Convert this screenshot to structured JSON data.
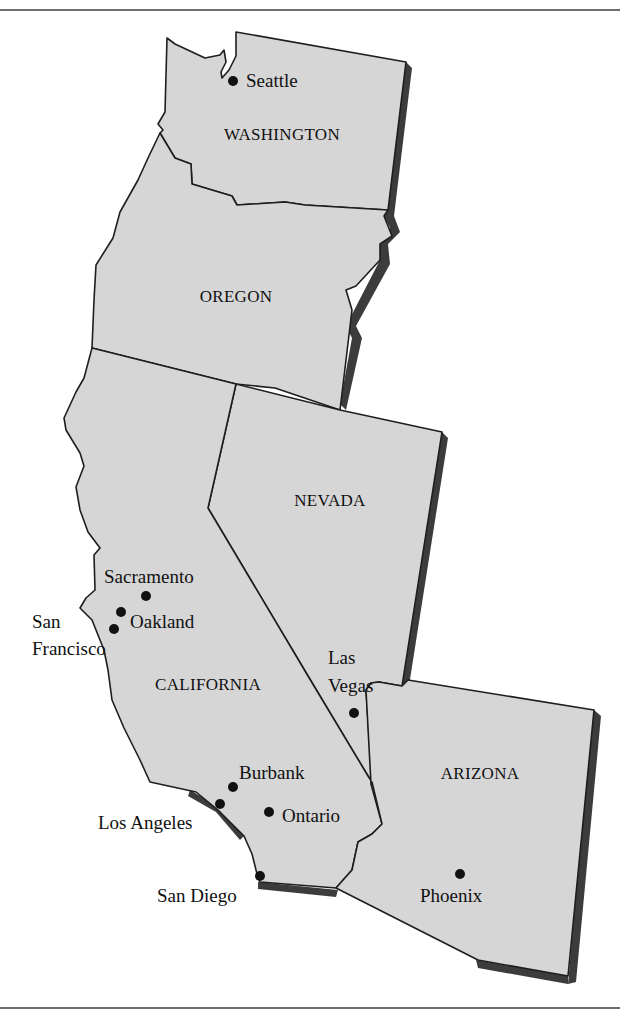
{
  "map": {
    "title": "",
    "region": "Western United States",
    "colors": {
      "land": "#d6d6d6",
      "border": "#1e1e1e",
      "shadow": "#3c3c3c",
      "text": "#111111",
      "frame_rule": "#6e6e6e"
    },
    "states": [
      {
        "id": "washington",
        "label": "WASHINGTON",
        "label_x": 282,
        "label_y": 140
      },
      {
        "id": "oregon",
        "label": "OREGON",
        "label_x": 236,
        "label_y": 302
      },
      {
        "id": "nevada",
        "label": "NEVADA",
        "label_x": 330,
        "label_y": 506
      },
      {
        "id": "california",
        "label": "CALIFORNIA",
        "label_x": 208,
        "label_y": 690
      },
      {
        "id": "arizona",
        "label": "ARIZONA",
        "label_x": 480,
        "label_y": 779
      }
    ],
    "cities": [
      {
        "id": "seattle",
        "name": "Seattle",
        "dot_x": 233,
        "dot_y": 81,
        "lines": [
          "Seattle"
        ],
        "label_x": 246,
        "label_y": 86,
        "anchor": "start"
      },
      {
        "id": "sacramento",
        "name": "Sacramento",
        "dot_x": 146,
        "dot_y": 596,
        "lines": [
          "Sacramento"
        ],
        "label_x": 104,
        "label_y": 583,
        "anchor": "start"
      },
      {
        "id": "oakland",
        "name": "Oakland",
        "dot_x": 121,
        "dot_y": 612,
        "lines": [
          "Oakland"
        ],
        "label_x": 130,
        "label_y": 628,
        "anchor": "start"
      },
      {
        "id": "san-francisco",
        "name": "San Francisco",
        "dot_x": 114,
        "dot_y": 629,
        "lines": [
          "San",
          "Francisco"
        ],
        "label_x": 32,
        "label_y": 628,
        "anchor": "start"
      },
      {
        "id": "las-vegas",
        "name": "Las Vegas",
        "dot_x": 354,
        "dot_y": 713,
        "lines": [
          "Las",
          "Vegas"
        ],
        "label_x": 328,
        "label_y": 664,
        "anchor": "start"
      },
      {
        "id": "burbank",
        "name": "Burbank",
        "dot_x": 233,
        "dot_y": 787,
        "lines": [
          "Burbank"
        ],
        "label_x": 239,
        "label_y": 779,
        "anchor": "start"
      },
      {
        "id": "los-angeles",
        "name": "Los Angeles",
        "dot_x": 220,
        "dot_y": 804,
        "lines": [
          "Los Angeles"
        ],
        "label_x": 98,
        "label_y": 829,
        "anchor": "start"
      },
      {
        "id": "ontario",
        "name": "Ontario",
        "dot_x": 269,
        "dot_y": 812,
        "lines": [
          "Ontario"
        ],
        "label_x": 282,
        "label_y": 822,
        "anchor": "start"
      },
      {
        "id": "san-diego",
        "name": "San Diego",
        "dot_x": 260,
        "dot_y": 876,
        "lines": [
          "San Diego"
        ],
        "label_x": 157,
        "label_y": 902,
        "anchor": "start"
      },
      {
        "id": "phoenix",
        "name": "Phoenix",
        "dot_x": 460,
        "dot_y": 874,
        "lines": [
          "Phoenix"
        ],
        "label_x": 420,
        "label_y": 902,
        "anchor": "start"
      }
    ]
  }
}
